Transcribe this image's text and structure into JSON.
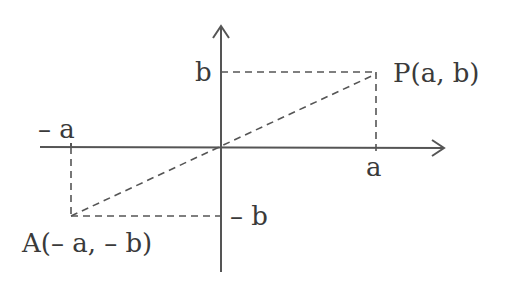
{
  "diagram": {
    "type": "coordinate-plane",
    "colors": {
      "stroke": "#555555",
      "text": "#3a3a3a",
      "background": "#ffffff"
    },
    "labels": {
      "point_p": "P(a, b)",
      "point_a": "A(– a, – b)",
      "y_tick_pos": "b",
      "y_tick_neg": "– b",
      "x_tick_pos": "a",
      "x_tick_neg": "– a"
    },
    "points": [
      {
        "name": "P",
        "coords": [
          "a",
          "b"
        ]
      },
      {
        "name": "A",
        "coords": [
          "-a",
          "-b"
        ]
      },
      {
        "name": "O",
        "coords": [
          0,
          0
        ]
      }
    ],
    "segments": [
      {
        "from": "A",
        "to": "P",
        "style": "dashed",
        "passes_through": "O"
      }
    ]
  }
}
